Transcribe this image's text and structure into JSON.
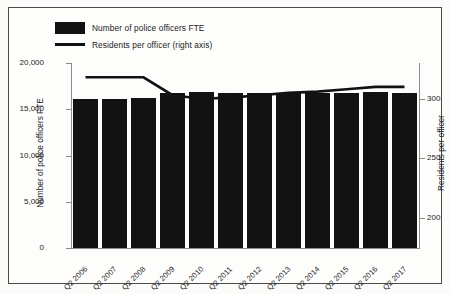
{
  "chart_data": {
    "type": "bar",
    "title": "",
    "xlabel": "",
    "categories": [
      "Q2 2006",
      "Q2 2007",
      "Q2 2008",
      "Q2 2009",
      "Q2 2010",
      "Q2 2011",
      "Q2 2012",
      "Q2 2013",
      "Q2 2014",
      "Q2 2015",
      "Q2 2016",
      "Q2 2017"
    ],
    "series": [
      {
        "name": "Number of police officers FTE",
        "type": "bar",
        "axis": "left",
        "color": "#121212",
        "values": [
          16100,
          16150,
          16200,
          16800,
          16850,
          16800,
          16800,
          16800,
          16800,
          16800,
          16850,
          16800
        ]
      },
      {
        "name": "Residents per officer (right axis)",
        "type": "line",
        "axis": "right",
        "color": "#121212",
        "values": [
          318,
          318,
          318,
          303,
          300,
          301,
          303,
          305,
          306,
          308,
          310,
          310
        ]
      }
    ],
    "ylabel": "Number of police officers FTE",
    "ylim": [
      0,
      20000
    ],
    "yticks": [
      0,
      5000,
      10000,
      15000,
      20000
    ],
    "ytick_labels": [
      "0",
      "5,000",
      "10,000",
      "15,000",
      "20,000"
    ],
    "y2label": "Residents per officer",
    "y2lim": [
      175,
      330
    ],
    "y2ticks": [
      200,
      250,
      300
    ],
    "y2tick_labels": [
      "200",
      "250",
      "300"
    ],
    "grid": false,
    "legend_position": "top-left"
  },
  "legend": {
    "items": [
      {
        "label": "Number of police officers FTE",
        "marker": "bar-swatch"
      },
      {
        "label": "Residents per officer (right axis)",
        "marker": "line-swatch"
      }
    ]
  }
}
